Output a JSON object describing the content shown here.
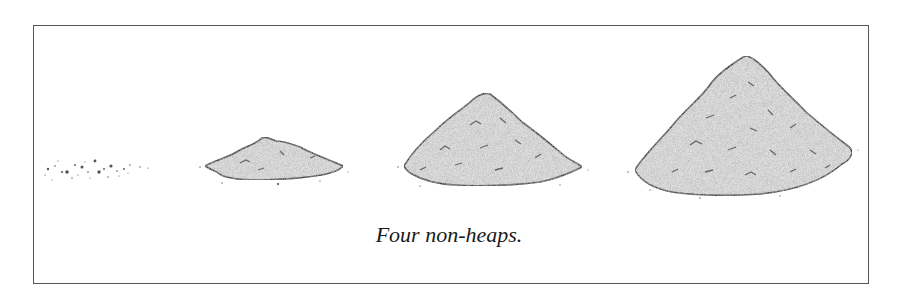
{
  "figure": {
    "caption": "Four non-heaps.",
    "piles": [
      {
        "id": 1,
        "label": "scattered grains"
      },
      {
        "id": 2,
        "label": "small pile"
      },
      {
        "id": 3,
        "label": "medium pile"
      },
      {
        "id": 4,
        "label": "large pile"
      }
    ],
    "colors": {
      "outline": "#4a4a4a",
      "fill": "#d9d9d9",
      "speckle": "#777777",
      "border": "#555555"
    }
  }
}
